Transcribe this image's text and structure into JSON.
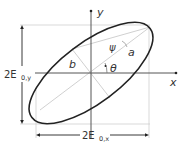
{
  "diagram": {
    "labels": {
      "y_axis": "y",
      "x_axis": "x",
      "semi_major": "a",
      "semi_minor": "b",
      "psi": "ψ",
      "theta": "θ",
      "height_label_main": "2E",
      "height_label_sub": "0,y",
      "width_label_main": "2E",
      "width_label_sub": "0,x"
    },
    "colors": {
      "ellipse": "#222222",
      "axes": "#444444",
      "guides": "#c8c8c8",
      "text": "#333333"
    }
  }
}
